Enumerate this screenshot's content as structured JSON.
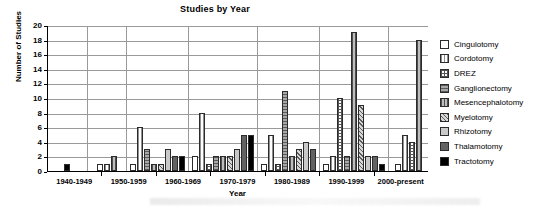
{
  "chart_data": {
    "type": "bar",
    "title": "Studies by Year",
    "xlabel": "Year",
    "ylabel": "Number of Studies",
    "ylim": [
      0,
      20
    ],
    "ytick_step": 2,
    "yticks": [
      "20",
      "18",
      "16",
      "14",
      "12",
      "10",
      "8",
      "6",
      "4",
      "2",
      "0"
    ],
    "grid": true,
    "legend_position": "right",
    "categories": [
      "1940-1949",
      "1950-1959",
      "1960-1969",
      "1970-1979",
      "1980-1989",
      "1990-1999",
      "2000-present"
    ],
    "series": [
      {
        "name": "Cingulotomy",
        "key": "cingulotomy",
        "values": [
          0,
          1,
          1,
          2,
          1,
          1,
          1
        ]
      },
      {
        "name": "Cordotomy",
        "key": "cordotomy",
        "values": [
          0,
          1,
          6,
          8,
          5,
          2,
          5
        ]
      },
      {
        "name": "DREZ",
        "key": "drez",
        "values": [
          0,
          0,
          0,
          1,
          1,
          10,
          4
        ]
      },
      {
        "name": "Ganglionectomy",
        "key": "ganglionectomy",
        "values": [
          0,
          0,
          3,
          2,
          11,
          2,
          0
        ]
      },
      {
        "name": "Mesencephalotomy",
        "key": "mesencephalotomy",
        "values": [
          0,
          2,
          1,
          2,
          2,
          19,
          18
        ]
      },
      {
        "name": "Myelotomy",
        "key": "myelotomy",
        "values": [
          0,
          0,
          1,
          2,
          3,
          9,
          0
        ]
      },
      {
        "name": "Rhizotomy",
        "key": "rhizotomy",
        "values": [
          0,
          0,
          3,
          3,
          4,
          2,
          0
        ]
      },
      {
        "name": "Thalamotomy",
        "key": "thalamotomy",
        "values": [
          0,
          0,
          2,
          5,
          3,
          2,
          0
        ]
      },
      {
        "name": "Tractotomy",
        "key": "tractotomy",
        "values": [
          1,
          0,
          2,
          5,
          0,
          1,
          0
        ]
      }
    ],
    "legend_entries": [
      "Cingulotomy",
      "Cordotomy",
      "DREZ",
      "Ganglionectomy",
      "Mesencephalotomy",
      "Myelotomy",
      "Rhizotomy",
      "Thalamotomy",
      "Tractotomy"
    ]
  },
  "colors": {
    "axis": "#000000",
    "gridline": "#9a9a9a",
    "plot_background": "#ffffff",
    "bar_outline": "#2b2b2b"
  }
}
